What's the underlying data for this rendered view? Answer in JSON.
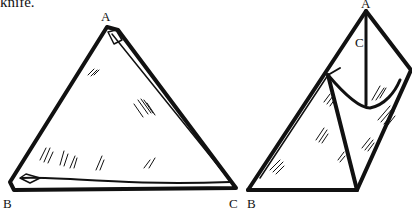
{
  "caption_fragment": "knife.",
  "figures": [
    {
      "name": "flat-triangle",
      "labels": {
        "top": "A",
        "bottom_left": "B",
        "bottom_right": "C"
      }
    },
    {
      "name": "folded-cone",
      "labels": {
        "top": "A",
        "inner": "C",
        "bottom_left": "B"
      }
    }
  ],
  "colors": {
    "ink": "#111111",
    "paper": "#ffffff"
  }
}
